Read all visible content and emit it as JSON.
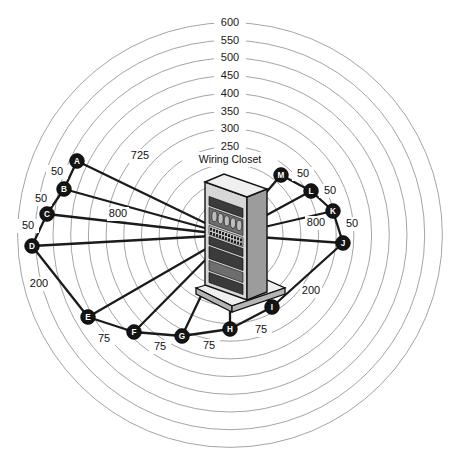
{
  "diagram": {
    "title": "Wiring Closet",
    "center_label": "Wiring Closet",
    "center_icon": "server-rack-icon",
    "background": "#ffffff",
    "ring_color": "#9a9a9a",
    "link_color": "#1b1b1b",
    "node_fill": "#141414",
    "node_text_color": "#ffffff"
  },
  "chart_data": {
    "type": "scatter",
    "title": "Wiring Closet",
    "xlabel": "",
    "ylabel": "",
    "grid": true,
    "legend_position": "none",
    "axis_type": "polar-radial",
    "center": {
      "x": 230,
      "y": 235,
      "label": "Wiring Closet"
    },
    "radial_rings": {
      "tick_labels": [
        "600",
        "550",
        "500",
        "450",
        "400",
        "350",
        "300",
        "250"
      ],
      "values": [
        600,
        550,
        500,
        450,
        400,
        350,
        300,
        250
      ],
      "extra_unlabeled_rings": [
        200,
        150,
        100,
        50
      ],
      "units_per_pixel": 2.825,
      "label_angle": "top"
    },
    "nodes": [
      {
        "id": "A",
        "x": 77,
        "y": 161,
        "radial_value": 725
      },
      {
        "id": "B",
        "x": 64,
        "y": 189,
        "radial_value": 740
      },
      {
        "id": "C",
        "x": 47,
        "y": 214,
        "radial_value": 790
      },
      {
        "id": "D",
        "x": 32,
        "y": 246,
        "radial_value": 800
      },
      {
        "id": "E",
        "x": 88,
        "y": 317,
        "radial_value": 480
      },
      {
        "id": "F",
        "x": 134,
        "y": 332,
        "radial_value": 355
      },
      {
        "id": "G",
        "x": 182,
        "y": 336,
        "radial_value": 290
      },
      {
        "id": "H",
        "x": 230,
        "y": 329,
        "radial_value": 265
      },
      {
        "id": "I",
        "x": 272,
        "y": 307,
        "radial_value": 235
      },
      {
        "id": "J",
        "x": 343,
        "y": 243,
        "radial_value": 320
      },
      {
        "id": "K",
        "x": 333,
        "y": 211,
        "radial_value": 305
      },
      {
        "id": "L",
        "x": 311,
        "y": 191,
        "radial_value": 265
      },
      {
        "id": "M",
        "x": 281,
        "y": 175,
        "radial_value": 195
      }
    ],
    "spoke_links": [
      {
        "from": "closet",
        "to": "A"
      },
      {
        "from": "closet",
        "to": "B"
      },
      {
        "from": "closet",
        "to": "C"
      },
      {
        "from": "closet",
        "to": "D"
      },
      {
        "from": "closet",
        "to": "E"
      },
      {
        "from": "closet",
        "to": "F"
      },
      {
        "from": "closet",
        "to": "G"
      },
      {
        "from": "closet",
        "to": "H"
      },
      {
        "from": "closet",
        "to": "I"
      },
      {
        "from": "closet",
        "to": "J"
      },
      {
        "from": "closet",
        "to": "K"
      },
      {
        "from": "closet",
        "to": "L"
      },
      {
        "from": "closet",
        "to": "M"
      }
    ],
    "chain_links": [
      {
        "from": "A",
        "to": "B",
        "label": "50"
      },
      {
        "from": "B",
        "to": "C",
        "label": "50"
      },
      {
        "from": "C",
        "to": "D",
        "label": "50"
      },
      {
        "from": "D",
        "to": "E",
        "label": "200"
      },
      {
        "from": "E",
        "to": "F",
        "label": "75"
      },
      {
        "from": "F",
        "to": "G",
        "label": "75"
      },
      {
        "from": "G",
        "to": "H",
        "label": "75"
      },
      {
        "from": "H",
        "to": "I",
        "label": "75"
      },
      {
        "from": "I",
        "to": "J",
        "label": "200"
      },
      {
        "from": "J",
        "to": "K",
        "label": "50"
      },
      {
        "from": "K",
        "to": "L",
        "label": "50"
      },
      {
        "from": "L",
        "to": "M",
        "label": "50"
      }
    ],
    "distance_annotations": [
      {
        "text": "725",
        "x": 140,
        "y": 156
      },
      {
        "text": "800",
        "x": 118,
        "y": 214
      },
      {
        "text": "800",
        "x": 316,
        "y": 223
      },
      {
        "text": "50",
        "x": 57,
        "y": 172
      },
      {
        "text": "50",
        "x": 41,
        "y": 199
      },
      {
        "text": "50",
        "x": 28,
        "y": 226
      },
      {
        "text": "200",
        "x": 39,
        "y": 284
      },
      {
        "text": "75",
        "x": 104,
        "y": 339
      },
      {
        "text": "75",
        "x": 160,
        "y": 347
      },
      {
        "text": "75",
        "x": 209,
        "y": 346
      },
      {
        "text": "75",
        "x": 261,
        "y": 330
      },
      {
        "text": "200",
        "x": 311,
        "y": 291
      },
      {
        "text": "50",
        "x": 303,
        "y": 174
      },
      {
        "text": "50",
        "x": 330,
        "y": 191
      },
      {
        "text": "50",
        "x": 352,
        "y": 224
      }
    ]
  }
}
